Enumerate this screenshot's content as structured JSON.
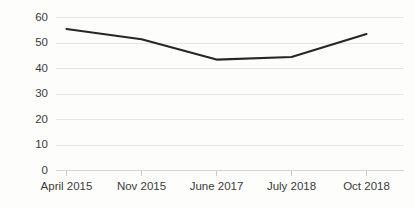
{
  "chart_data": {
    "type": "line",
    "title": "",
    "subtitle": "",
    "xlabel": "",
    "ylabel": "",
    "categories": [
      "April 2015",
      "Nov 2015",
      "June 2017",
      "July 2018",
      "Oct 2018"
    ],
    "series": [
      {
        "name": "",
        "values": [
          55.5,
          51.5,
          43.5,
          44.5,
          53.5
        ],
        "color": "#262626"
      }
    ],
    "ylim": [
      0,
      60
    ],
    "yticks": [
      0,
      10,
      20,
      30,
      40,
      50,
      60
    ],
    "ytick_labels": [
      "0",
      "10",
      "20",
      "30",
      "40",
      "50",
      "60"
    ],
    "grid": true,
    "grid_axis": "y",
    "legend": false,
    "legend_position": "none",
    "colors": {
      "line": "#262626",
      "grid": "#e6e6e6",
      "axis": "#d4d4d4",
      "tick_text": "#3b3b3b",
      "background": "#fdfdfc"
    }
  },
  "axis": {
    "y_labels": [
      "60",
      "50",
      "40",
      "30",
      "20",
      "10",
      "0"
    ],
    "x_labels": [
      "April 2015",
      "Nov 2015",
      "June 2017",
      "July 2018",
      "Oct 2018"
    ]
  }
}
